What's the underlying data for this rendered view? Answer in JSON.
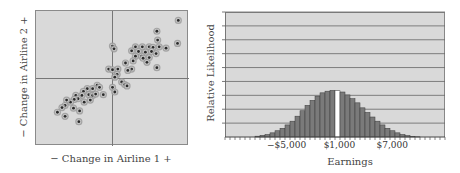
{
  "chart_data": [
    {
      "type": "scatter",
      "title": "",
      "xlabel": "− Change in Airline 1 +",
      "ylabel": "− Change in Airline 2 +",
      "grid": false,
      "crosshair": {
        "x": 0,
        "y": 0
      },
      "xlim": [
        -1,
        1
      ],
      "ylim": [
        -1,
        1
      ],
      "points": [
        [
          0.86,
          0.86
        ],
        [
          0.58,
          0.7
        ],
        [
          0.59,
          0.57
        ],
        [
          0.85,
          0.52
        ],
        [
          0.3,
          0.47
        ],
        [
          0.39,
          0.47
        ],
        [
          0.48,
          0.47
        ],
        [
          0.53,
          0.46
        ],
        [
          0.61,
          0.47
        ],
        [
          0.7,
          0.45
        ],
        [
          0.0,
          0.48
        ],
        [
          0.02,
          0.44
        ],
        [
          0.25,
          0.41
        ],
        [
          0.34,
          0.4
        ],
        [
          0.43,
          0.39
        ],
        [
          0.51,
          0.4
        ],
        [
          0.3,
          0.33
        ],
        [
          0.38,
          0.33
        ],
        [
          0.57,
          0.37
        ],
        [
          0.27,
          0.26
        ],
        [
          0.4,
          0.3
        ],
        [
          0.48,
          0.31
        ],
        [
          0.45,
          0.24
        ],
        [
          0.17,
          0.23
        ],
        [
          0.58,
          0.16
        ],
        [
          0.25,
          0.14
        ],
        [
          0.2,
          0.12
        ],
        [
          -0.05,
          0.14
        ],
        [
          0.0,
          0.13
        ],
        [
          0.07,
          0.14
        ],
        [
          0.06,
          0.06
        ],
        [
          0.03,
          0.02
        ],
        [
          0.12,
          -0.05
        ],
        [
          0.16,
          -0.09
        ],
        [
          0.19,
          -0.11
        ],
        [
          0.0,
          -0.13
        ],
        [
          0.03,
          -0.2
        ],
        [
          -0.2,
          -0.1
        ],
        [
          -0.17,
          -0.13
        ],
        [
          -0.26,
          -0.15
        ],
        [
          -0.33,
          -0.15
        ],
        [
          -0.38,
          -0.19
        ],
        [
          -0.31,
          -0.24
        ],
        [
          -0.26,
          -0.25
        ],
        [
          -0.22,
          -0.23
        ],
        [
          -0.4,
          -0.25
        ],
        [
          -0.48,
          -0.25
        ],
        [
          -0.45,
          -0.3
        ],
        [
          -0.5,
          -0.31
        ],
        [
          -0.37,
          -0.35
        ],
        [
          -0.29,
          -0.32
        ],
        [
          -0.12,
          -0.24
        ],
        [
          -0.55,
          -0.35
        ],
        [
          -0.6,
          -0.32
        ],
        [
          -0.62,
          -0.4
        ],
        [
          -0.51,
          -0.44
        ],
        [
          -0.66,
          -0.43
        ],
        [
          -0.43,
          -0.48
        ],
        [
          -0.72,
          -0.5
        ],
        [
          -0.62,
          -0.56
        ],
        [
          -0.44,
          -0.64
        ]
      ]
    },
    {
      "type": "bar",
      "title": "",
      "xlabel": "Earnings",
      "ylabel": "Relative Likelihood",
      "grid": true,
      "tick_labels": [
        {
          "label": "−$5,000",
          "position": 0.28
        },
        {
          "label": "$1,000",
          "position": 0.52
        },
        {
          "label": "$7,000",
          "position": 0.76
        }
      ],
      "gridlines": 9,
      "highlighted_bin_color": "#ffffff",
      "bar_color": "#7a7a7a",
      "values": [
        0,
        0,
        0,
        0,
        0,
        0,
        0.2,
        0.4,
        0.6,
        1,
        1.5,
        2.1,
        2.9,
        3.8,
        5,
        6.3,
        7.6,
        8.8,
        9.8,
        10.6,
        11,
        11.2,
        11.1,
        10.8,
        10.1,
        9.2,
        8.2,
        7,
        5.9,
        4.8,
        3.8,
        2.9,
        2.1,
        1.5,
        1,
        0.6,
        0.35,
        0.15,
        0.05,
        0,
        0,
        0,
        0,
        0
      ],
      "highlight_index": 22,
      "ylim": [
        0,
        30
      ]
    }
  ]
}
